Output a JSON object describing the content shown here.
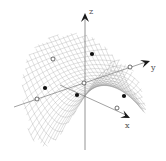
{
  "figure": {
    "axes": {
      "x": {
        "label": "x",
        "label_pos": [
          125,
          123
        ],
        "arrow_tip": [
          130,
          118
        ],
        "arrow_from": [
          60,
          85
        ]
      },
      "y": {
        "label": "y",
        "label_pos": [
          150,
          65
        ],
        "arrow_tip": [
          150,
          61
        ],
        "arrow_from": [
          84,
          83
        ]
      },
      "z": {
        "label": "z",
        "label_pos": [
          89,
          11
        ],
        "arrow_tip": [
          85,
          13
        ],
        "arrow_from": [
          85,
          150
        ]
      },
      "neg_x_line": {
        "from": [
          14,
          107
        ],
        "to": [
          84,
          83
        ]
      }
    },
    "colors": {
      "mesh": "#9a9a9a",
      "axis": "#7a7a7a",
      "arrow": "#1a1a1a",
      "filled_point": "#111111",
      "open_point_fill": "#ffffff",
      "open_point_stroke": "#333333"
    },
    "points_filled": [
      {
        "x": 92,
        "y": 54
      },
      {
        "x": 45,
        "y": 88
      },
      {
        "x": 77,
        "y": 95
      },
      {
        "x": 124,
        "y": 96
      }
    ],
    "points_open": [
      {
        "x": 53,
        "y": 59
      },
      {
        "x": 130,
        "y": 67
      },
      {
        "x": 84,
        "y": 83
      },
      {
        "x": 37,
        "y": 99
      },
      {
        "x": 117,
        "y": 108
      }
    ]
  }
}
